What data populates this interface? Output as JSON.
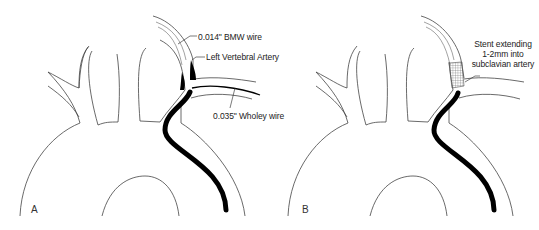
{
  "figure": {
    "panels": [
      {
        "id": "A",
        "letter": "A",
        "labels": {
          "bmw_wire": "0.014\" BMW wire",
          "left_vertebral": "Left Vertebral Artery",
          "wholey_wire": "0.035\" Wholey wire"
        }
      },
      {
        "id": "B",
        "letter": "B",
        "labels": {
          "stent_line1": "Stent extending",
          "stent_line2": "1-2mm into",
          "stent_line3": "subclavian artery"
        }
      }
    ],
    "colors": {
      "line": "#333333",
      "wire": "#000000",
      "background": "#ffffff"
    }
  }
}
